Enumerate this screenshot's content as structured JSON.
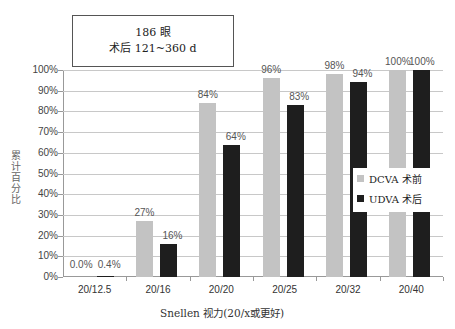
{
  "title_box": {
    "line1": "186 眼",
    "line2": "术后 121~360 d"
  },
  "colors": {
    "dcva": "#c3c3c3",
    "udva": "#1e1e1e",
    "grid": "#c8c8c8"
  },
  "chart_data": {
    "type": "bar",
    "title": "186 眼 术后 121~360 d",
    "xlabel": "Snellen 视力(20/x或更好)",
    "ylabel": "累计百分比",
    "ylim": [
      0,
      100
    ],
    "yticks": [
      "0%",
      "10%",
      "20%",
      "30%",
      "40%",
      "50%",
      "60%",
      "70%",
      "80%",
      "90%",
      "100%"
    ],
    "categories": [
      "20/12.5",
      "20/16",
      "20/20",
      "20/25",
      "20/32",
      "20/40"
    ],
    "series": [
      {
        "name": "DCVA 术前",
        "values": [
          0.0,
          27,
          84,
          96,
          98,
          100
        ],
        "labels": [
          "0.0%",
          "27%",
          "84%",
          "96%",
          "98%",
          "100%"
        ]
      },
      {
        "name": "UDVA 术后",
        "values": [
          0.4,
          16,
          64,
          83,
          94,
          100
        ],
        "labels": [
          "0.4%",
          "16%",
          "64%",
          "83%",
          "94%",
          "100%"
        ]
      }
    ],
    "grid": true,
    "legend_position": "right-middle"
  },
  "legend": {
    "dcva": "DCVA 术前",
    "udva": "UDVA 术后"
  },
  "axis": {
    "xlabel": "Snellen 视力(20/x或更好)",
    "ylabel": "累计百分比"
  }
}
